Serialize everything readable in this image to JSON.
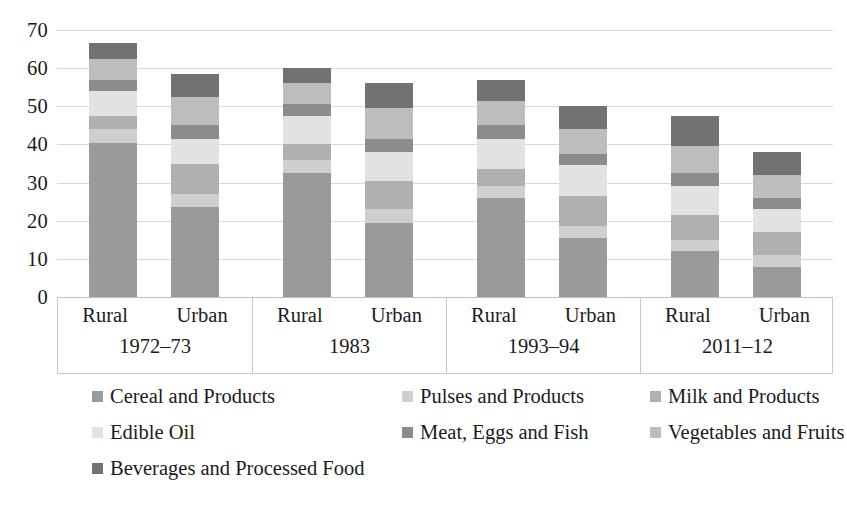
{
  "chart_data": {
    "type": "bar",
    "subtype": "stacked-bar",
    "title": "",
    "subtitle": "",
    "xlabel": "",
    "ylabel": "",
    "ylim": [
      0,
      70
    ],
    "ytick_values": [
      0,
      10,
      20,
      30,
      40,
      50,
      60,
      70
    ],
    "ytick_labels": [
      "0",
      "10",
      "20",
      "30",
      "40",
      "50",
      "60",
      "70"
    ],
    "grid": true,
    "legend_position": "bottom",
    "categories": [
      "1972–73 Rural",
      "1972–73 Urban",
      "1983 Rural",
      "1983 Urban",
      "1993–94 Rural",
      "1993–94 Urban",
      "2011–12 Rural",
      "2011–12 Urban"
    ],
    "groups": [
      {
        "period": "1972–73",
        "sectors": [
          "Rural",
          "Urban"
        ]
      },
      {
        "period": "1983",
        "sectors": [
          "Rural",
          "Urban"
        ]
      },
      {
        "period": "1993–94",
        "sectors": [
          "Rural",
          "Urban"
        ]
      },
      {
        "period": "2011–12",
        "sectors": [
          "Rural",
          "Urban"
        ]
      }
    ],
    "series": [
      {
        "name": "Cereal and Products",
        "color": "#9a9a9a",
        "values": [
          40.5,
          23.5,
          32.5,
          19.5,
          26.0,
          15.5,
          12.0,
          8.0
        ]
      },
      {
        "name": "Pulses and Products",
        "color": "#cfcfcf",
        "values": [
          3.5,
          3.5,
          3.5,
          3.5,
          3.0,
          3.0,
          3.0,
          3.0
        ]
      },
      {
        "name": "Milk and Products",
        "color": "#b0b0b0",
        "values": [
          3.5,
          8.0,
          4.0,
          7.5,
          4.5,
          8.0,
          6.5,
          6.0
        ]
      },
      {
        "name": "Edible Oil",
        "color": "#e2e2e2",
        "values": [
          6.5,
          6.5,
          7.5,
          7.5,
          8.0,
          8.0,
          7.5,
          6.0
        ]
      },
      {
        "name": "Meat, Eggs and Fish",
        "color": "#8c8c8c",
        "values": [
          3.0,
          3.5,
          3.0,
          3.5,
          3.5,
          3.0,
          3.5,
          3.0
        ]
      },
      {
        "name": "Vegetables and Fruits",
        "color": "#bdbdbd",
        "values": [
          5.5,
          7.5,
          5.5,
          8.0,
          6.5,
          6.5,
          7.0,
          6.0
        ]
      },
      {
        "name": "Beverages and Processed Food",
        "color": "#727272",
        "values": [
          4.0,
          6.0,
          4.0,
          6.5,
          5.5,
          6.0,
          8.0,
          6.0
        ]
      }
    ],
    "totals": [
      66.5,
      58.5,
      60.0,
      56.0,
      57.0,
      50.0,
      47.5,
      38.0
    ]
  },
  "legend": {
    "items": [
      {
        "label": "Cereal and Products"
      },
      {
        "label": "Pulses and Products"
      },
      {
        "label": "Milk and Products"
      },
      {
        "label": "Edible Oil"
      },
      {
        "label": "Meat, Eggs and Fish"
      },
      {
        "label": "Vegetables and Fruits"
      },
      {
        "label": "Beverages and Processed Food"
      }
    ]
  }
}
